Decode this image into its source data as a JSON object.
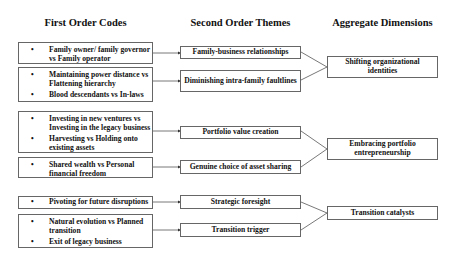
{
  "headers": {
    "first": "First Order Codes",
    "second": "Second Order Themes",
    "aggregate": "Aggregate Dimensions"
  },
  "first_order": [
    {
      "items": [
        "Family owner/ family governor vs Family operator"
      ]
    },
    {
      "items": [
        "Maintaining power distance vs Flattening hierarchy",
        "Blood descendants vs In-laws"
      ]
    },
    {
      "items": [
        "Investing in new ventures vs Investing in the legacy business",
        "Harvesting vs Holding onto existing assets"
      ]
    },
    {
      "items": [
        "Shared wealth vs Personal financial freedom"
      ]
    },
    {
      "items": [
        "Pivoting for future disruptions"
      ]
    },
    {
      "items": [
        "Natural evolution vs Planned transition",
        "Exit of legacy business"
      ]
    }
  ],
  "second_order": [
    "Family-business relationships",
    "Diminishing intra-family faultlines",
    "Portfolio value creation",
    "Genuine choice of asset sharing",
    "Strategic foresight",
    "Transition trigger"
  ],
  "aggregate": [
    "Shifting organizational identities",
    "Embracing portfolio entrepreneurship",
    "Transition catalysts"
  ]
}
